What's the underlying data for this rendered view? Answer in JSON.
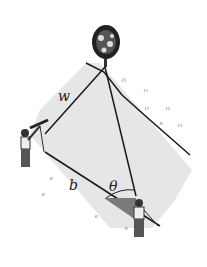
{
  "figure": {
    "labels": {
      "w": "w",
      "b": "b",
      "theta": "θ"
    },
    "elements": [
      "tree",
      "surveyor-left",
      "surveyor-right",
      "field-region",
      "angle-wedge"
    ],
    "colors": {
      "field": "#e6e6e6",
      "lines": "#1a1a1a",
      "wedge": "#7a7a7a",
      "background": "#ffffff"
    }
  }
}
